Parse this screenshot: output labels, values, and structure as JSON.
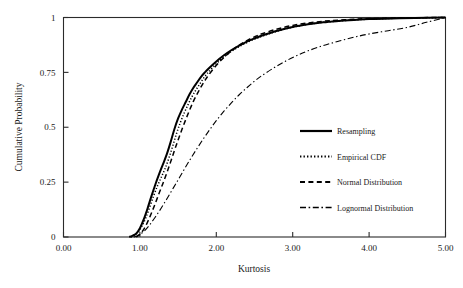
{
  "chart_data": {
    "type": "line",
    "title": "",
    "xlabel": "Kurtosis",
    "ylabel": "Cumulative Probability",
    "xlim": [
      0.0,
      5.0
    ],
    "ylim": [
      0.0,
      1.0
    ],
    "grid": false,
    "legend_position": "center-right",
    "xticks": [
      {
        "value": 0.0,
        "label": "0.00"
      },
      {
        "value": 1.0,
        "label": "1.00"
      },
      {
        "value": 2.0,
        "label": "2.00"
      },
      {
        "value": 3.0,
        "label": "3.00"
      },
      {
        "value": 4.0,
        "label": "4.00"
      },
      {
        "value": 5.0,
        "label": "5.00"
      }
    ],
    "yticks": [
      {
        "value": 0.0,
        "label": "0"
      },
      {
        "value": 0.25,
        "label": "0.25"
      },
      {
        "value": 0.5,
        "label": "0.5"
      },
      {
        "value": 0.75,
        "label": "0.75"
      },
      {
        "value": 1.0,
        "label": "1"
      }
    ],
    "series": [
      {
        "name": "Resampling",
        "style": "solid",
        "points": [
          [
            0.86,
            0.0
          ],
          [
            0.9,
            0.005
          ],
          [
            0.95,
            0.015
          ],
          [
            1.0,
            0.04
          ],
          [
            1.05,
            0.08
          ],
          [
            1.1,
            0.13
          ],
          [
            1.15,
            0.185
          ],
          [
            1.2,
            0.237
          ],
          [
            1.25,
            0.285
          ],
          [
            1.3,
            0.33
          ],
          [
            1.35,
            0.375
          ],
          [
            1.4,
            0.43
          ],
          [
            1.45,
            0.49
          ],
          [
            1.5,
            0.54
          ],
          [
            1.55,
            0.58
          ],
          [
            1.6,
            0.615
          ],
          [
            1.65,
            0.65
          ],
          [
            1.7,
            0.68
          ],
          [
            1.75,
            0.705
          ],
          [
            1.8,
            0.73
          ],
          [
            1.85,
            0.75
          ],
          [
            1.9,
            0.768
          ],
          [
            2.0,
            0.8
          ],
          [
            2.1,
            0.828
          ],
          [
            2.2,
            0.852
          ],
          [
            2.3,
            0.872
          ],
          [
            2.4,
            0.89
          ],
          [
            2.5,
            0.905
          ],
          [
            2.6,
            0.918
          ],
          [
            2.8,
            0.94
          ],
          [
            3.0,
            0.957
          ],
          [
            3.2,
            0.969
          ],
          [
            3.4,
            0.978
          ],
          [
            3.6,
            0.984
          ],
          [
            3.8,
            0.989
          ],
          [
            4.0,
            0.993
          ],
          [
            4.3,
            0.996
          ],
          [
            4.6,
            0.998
          ],
          [
            5.0,
            1.0
          ]
        ]
      },
      {
        "name": "Empirical CDF",
        "style": "dotted",
        "points": [
          [
            0.88,
            0.0
          ],
          [
            0.93,
            0.008
          ],
          [
            0.98,
            0.022
          ],
          [
            1.03,
            0.052
          ],
          [
            1.08,
            0.09
          ],
          [
            1.13,
            0.138
          ],
          [
            1.18,
            0.188
          ],
          [
            1.23,
            0.233
          ],
          [
            1.28,
            0.272
          ],
          [
            1.33,
            0.312
          ],
          [
            1.38,
            0.36
          ],
          [
            1.43,
            0.415
          ],
          [
            1.48,
            0.472
          ],
          [
            1.53,
            0.522
          ],
          [
            1.58,
            0.565
          ],
          [
            1.63,
            0.603
          ],
          [
            1.68,
            0.638
          ],
          [
            1.73,
            0.668
          ],
          [
            1.78,
            0.695
          ],
          [
            1.83,
            0.722
          ],
          [
            1.88,
            0.744
          ],
          [
            1.95,
            0.772
          ],
          [
            2.05,
            0.806
          ],
          [
            2.15,
            0.834
          ],
          [
            2.25,
            0.857
          ],
          [
            2.35,
            0.877
          ],
          [
            2.45,
            0.894
          ],
          [
            2.55,
            0.908
          ],
          [
            2.7,
            0.927
          ],
          [
            2.9,
            0.948
          ],
          [
            3.1,
            0.963
          ],
          [
            3.3,
            0.974
          ],
          [
            3.5,
            0.981
          ],
          [
            3.75,
            0.988
          ],
          [
            4.0,
            0.992
          ],
          [
            4.3,
            0.996
          ],
          [
            4.65,
            0.998
          ],
          [
            5.0,
            1.0
          ]
        ]
      },
      {
        "name": "Normal Distribution",
        "style": "dashed",
        "points": [
          [
            0.95,
            0.0
          ],
          [
            1.0,
            0.012
          ],
          [
            1.05,
            0.035
          ],
          [
            1.1,
            0.068
          ],
          [
            1.15,
            0.108
          ],
          [
            1.2,
            0.152
          ],
          [
            1.25,
            0.198
          ],
          [
            1.3,
            0.243
          ],
          [
            1.35,
            0.29
          ],
          [
            1.4,
            0.34
          ],
          [
            1.45,
            0.392
          ],
          [
            1.5,
            0.442
          ],
          [
            1.55,
            0.49
          ],
          [
            1.6,
            0.535
          ],
          [
            1.65,
            0.578
          ],
          [
            1.7,
            0.618
          ],
          [
            1.75,
            0.652
          ],
          [
            1.8,
            0.684
          ],
          [
            1.85,
            0.712
          ],
          [
            1.9,
            0.738
          ],
          [
            2.0,
            0.782
          ],
          [
            2.1,
            0.818
          ],
          [
            2.2,
            0.848
          ],
          [
            2.3,
            0.874
          ],
          [
            2.4,
            0.895
          ],
          [
            2.5,
            0.912
          ],
          [
            2.6,
            0.926
          ],
          [
            2.8,
            0.948
          ],
          [
            3.0,
            0.964
          ],
          [
            3.2,
            0.975
          ],
          [
            3.4,
            0.983
          ],
          [
            3.6,
            0.988
          ],
          [
            3.8,
            0.992
          ],
          [
            4.0,
            0.995
          ],
          [
            4.3,
            0.997
          ],
          [
            4.6,
            0.999
          ],
          [
            5.0,
            1.0
          ]
        ]
      },
      {
        "name": "Lognormal Distribution",
        "style": "dashdot",
        "points": [
          [
            0.92,
            0.0
          ],
          [
            0.98,
            0.008
          ],
          [
            1.05,
            0.025
          ],
          [
            1.12,
            0.052
          ],
          [
            1.2,
            0.09
          ],
          [
            1.28,
            0.132
          ],
          [
            1.36,
            0.178
          ],
          [
            1.44,
            0.225
          ],
          [
            1.52,
            0.272
          ],
          [
            1.6,
            0.32
          ],
          [
            1.68,
            0.366
          ],
          [
            1.76,
            0.41
          ],
          [
            1.84,
            0.452
          ],
          [
            1.92,
            0.492
          ],
          [
            2.0,
            0.53
          ],
          [
            2.1,
            0.573
          ],
          [
            2.2,
            0.612
          ],
          [
            2.3,
            0.648
          ],
          [
            2.4,
            0.68
          ],
          [
            2.5,
            0.71
          ],
          [
            2.6,
            0.736
          ],
          [
            2.75,
            0.77
          ],
          [
            2.9,
            0.8
          ],
          [
            3.05,
            0.826
          ],
          [
            3.2,
            0.848
          ],
          [
            3.4,
            0.872
          ],
          [
            3.6,
            0.892
          ],
          [
            3.8,
            0.91
          ],
          [
            4.0,
            0.925
          ],
          [
            4.25,
            0.94
          ],
          [
            4.5,
            0.955
          ],
          [
            4.75,
            0.978
          ],
          [
            5.0,
            1.0
          ]
        ]
      }
    ]
  },
  "legend": {
    "entries": [
      {
        "label": "Resampling"
      },
      {
        "label": "Empirical CDF"
      },
      {
        "label": "Normal  Distribution"
      },
      {
        "label": "Lognormal  Distribution"
      }
    ]
  }
}
